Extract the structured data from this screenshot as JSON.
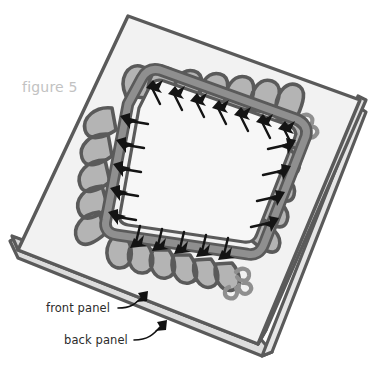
{
  "figure": {
    "caption": "figure 5",
    "caption_color": "#c2c2c2"
  },
  "labels": [
    {
      "id": "front-panel",
      "text": "front panel",
      "color": "#2b2b2b"
    },
    {
      "id": "back-panel",
      "text": "back panel",
      "color": "#2b2b2b"
    }
  ],
  "illustration": {
    "description": "pillow cover construction diagram",
    "panel_face_color": "#f2f2f2",
    "panel_inner_color": "#f7f7f7",
    "panel_edge_color": "#d6d6d6",
    "outline_color": "#5a5a5a",
    "trim_band_color": "#8f8f8f",
    "trim_ruffle_color": "#b4b4b4",
    "pin_color": "#141414",
    "arrow_color": "#111111"
  }
}
